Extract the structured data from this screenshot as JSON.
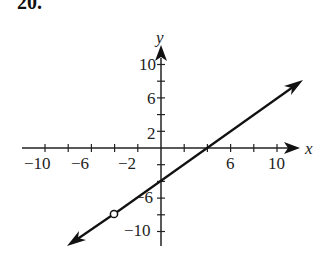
{
  "problem_number": "20.",
  "chart_data": {
    "type": "line",
    "title": "",
    "xlabel": "x",
    "ylabel": "y",
    "xlim": [
      -12,
      12
    ],
    "ylim": [
      -12,
      12
    ],
    "grid": false,
    "legend": null,
    "x_tick_labels": [
      "−10",
      "−6",
      "−2",
      "6",
      "10"
    ],
    "y_tick_labels": [
      "10",
      "6",
      "2",
      "6",
      "10"
    ],
    "y_tick_label_values": [
      10,
      6,
      2,
      -6,
      -10
    ],
    "x_ticks": [
      -10,
      -8,
      -6,
      -4,
      -2,
      2,
      4,
      6,
      8,
      10
    ],
    "y_ticks": [
      -10,
      -8,
      -6,
      -4,
      -2,
      2,
      4,
      6,
      8,
      10
    ],
    "series": [
      {
        "name": "y = x - 4",
        "equation": "y = x - 4",
        "slope": 1,
        "y_intercept": -4,
        "x_intercept": 4,
        "x": [
          -8,
          -4,
          0,
          4,
          12
        ],
        "y": [
          -12,
          -8,
          -4,
          0,
          8
        ],
        "arrows": "both ends",
        "color": "#111111"
      }
    ],
    "annotations": [
      {
        "type": "open-circle",
        "x": -4,
        "y": -8,
        "note": "point excluded from graph"
      }
    ]
  }
}
